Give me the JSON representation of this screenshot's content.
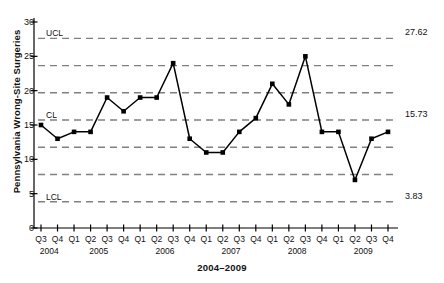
{
  "chart_data": {
    "type": "line",
    "title": "",
    "xlabel": "2004–2009",
    "ylabel": "Pennsylvania Wrong-Site Surgeries",
    "ylim": [
      0,
      30
    ],
    "yticks": [
      0,
      5,
      10,
      15,
      20,
      25,
      30
    ],
    "grid": false,
    "legend_position": "none",
    "categories": [
      "Q3",
      "Q4",
      "Q1",
      "Q2",
      "Q3",
      "Q4",
      "Q1",
      "Q2",
      "Q3",
      "Q4",
      "Q1",
      "Q2",
      "Q3",
      "Q4",
      "Q1",
      "Q2",
      "Q3",
      "Q4",
      "Q1",
      "Q2",
      "Q3",
      "Q4"
    ],
    "year_groups": [
      {
        "label": "2004",
        "index": 0
      },
      {
        "label": "2005",
        "index": 2
      },
      {
        "label": "2006",
        "index": 6
      },
      {
        "label": "2007",
        "index": 10
      },
      {
        "label": "2008",
        "index": 14
      },
      {
        "label": "2009",
        "index": 18
      }
    ],
    "values": [
      15,
      13,
      14,
      14,
      19,
      17,
      19,
      19,
      24,
      13,
      11,
      11,
      14,
      16,
      21,
      18,
      25,
      14,
      14,
      7,
      13,
      14
    ],
    "series": [
      {
        "name": "Pennsylvania Wrong-Site Surgeries",
        "values": [
          15,
          13,
          14,
          14,
          19,
          17,
          19,
          19,
          24,
          13,
          11,
          11,
          14,
          16,
          21,
          18,
          25,
          14,
          14,
          7,
          13,
          14
        ]
      }
    ],
    "control_lines": [
      {
        "name": "UCL",
        "label": "UCL",
        "value": 27.62,
        "value_label": "27.62",
        "show_name": true,
        "show_value": true
      },
      {
        "name": "2sigma_upper",
        "label": "",
        "value": 23.65,
        "value_label": "",
        "show_name": false,
        "show_value": false
      },
      {
        "name": "1sigma_upper",
        "label": "",
        "value": 19.69,
        "value_label": "",
        "show_name": false,
        "show_value": false
      },
      {
        "name": "CL",
        "label": "CL",
        "value": 15.73,
        "value_label": "15.73",
        "show_name": true,
        "show_value": true
      },
      {
        "name": "1sigma_lower",
        "label": "",
        "value": 11.76,
        "value_label": "",
        "show_name": false,
        "show_value": false
      },
      {
        "name": "2sigma_lower",
        "label": "",
        "value": 7.8,
        "value_label": "",
        "show_name": false,
        "show_value": false
      },
      {
        "name": "LCL",
        "label": "LCL",
        "value": 3.83,
        "value_label": "3.83",
        "show_name": true,
        "show_value": true
      }
    ],
    "colors": {
      "line": "#000000",
      "marker": "#000000",
      "control_line": "#808080",
      "axis": "#000000",
      "background": "#ffffff"
    }
  }
}
